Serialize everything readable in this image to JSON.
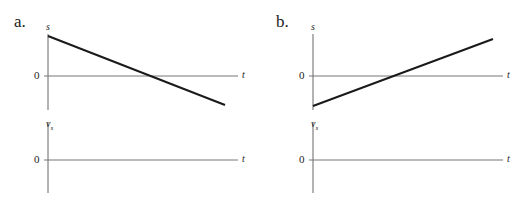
{
  "panels": [
    {
      "label": "a.",
      "position_graph": {
        "y_axis_label": "s",
        "x_axis_label": "t",
        "zero_label": "0",
        "line": "decreasing from positive s to negative s"
      },
      "velocity_graph": {
        "y_axis_label": "v",
        "y_axis_subscript": "s",
        "x_axis_label": "t",
        "zero_label": "0"
      }
    },
    {
      "label": "b.",
      "position_graph": {
        "y_axis_label": "s",
        "x_axis_label": "t",
        "zero_label": "0",
        "line": "increasing from negative s to positive s"
      },
      "velocity_graph": {
        "y_axis_label": "v",
        "y_axis_subscript": "s",
        "x_axis_label": "t",
        "zero_label": "0"
      }
    }
  ],
  "colors": {
    "axis": "#666666",
    "line": "#1a1a1a"
  }
}
